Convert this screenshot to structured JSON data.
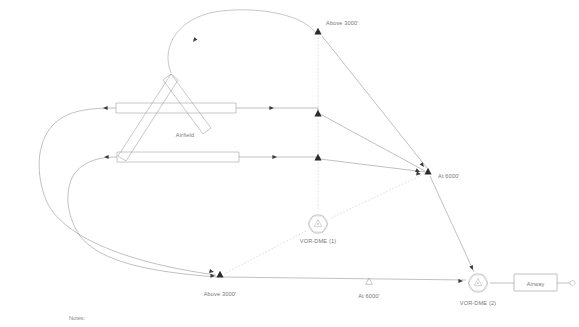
{
  "diagram": {
    "title_text": "",
    "notes_label": "Notes:",
    "airfield_label": "Airfield",
    "colors": {
      "route_line": "#8e8e8e",
      "radial_dashed": "#bdbdbd",
      "waypoint_filled": "#2b2b2b",
      "text": "#767676",
      "background": "#ffffff"
    },
    "waypoints": [
      {
        "id": "wp-above-3000-top",
        "label": "Above 3000'",
        "symbol": "filled-triangle",
        "x": 318,
        "y": 32
      },
      {
        "id": "wp-mid-upper",
        "label": "",
        "symbol": "filled-triangle",
        "x": 318,
        "y": 114
      },
      {
        "id": "wp-mid-lower",
        "label": "",
        "symbol": "filled-triangle",
        "x": 318,
        "y": 158
      },
      {
        "id": "wp-at-6000-right",
        "label": "At 6000'",
        "symbol": "filled-triangle",
        "x": 428,
        "y": 172
      },
      {
        "id": "wp-above-3000-bottom",
        "label": "Above 3000'",
        "symbol": "filled-triangle",
        "x": 220,
        "y": 275
      },
      {
        "id": "wp-at-6000-bottom",
        "label": "At 6000'",
        "symbol": "open-triangle",
        "x": 369,
        "y": 283
      }
    ],
    "navaids": [
      {
        "id": "vor-dme-1",
        "label": "VOR-DME (1)",
        "symbol": "vor-dme",
        "x": 318,
        "y": 224
      },
      {
        "id": "vor-dme-2",
        "label": "VOR-DME (2)",
        "symbol": "vor-dme",
        "x": 478,
        "y": 283
      }
    ],
    "airway": {
      "label": "Airway",
      "x": 535,
      "y": 283
    }
  }
}
